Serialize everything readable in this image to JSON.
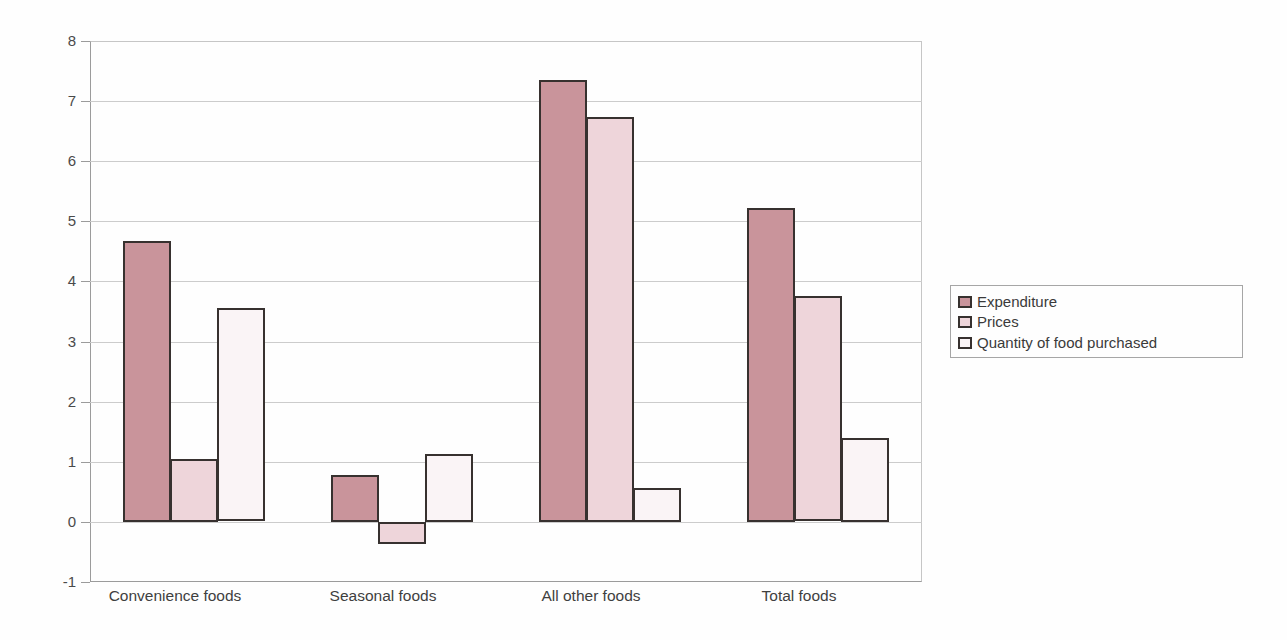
{
  "chart_data": {
    "type": "bar",
    "title": "",
    "xlabel": "",
    "ylabel": "",
    "categories": [
      "Convenience foods",
      "Seasonal foods",
      "All other foods",
      "Total foods"
    ],
    "series": [
      {
        "name": "Expenditure",
        "color": "#c9949b",
        "values": [
          4.67,
          0.78,
          7.35,
          5.22
        ]
      },
      {
        "name": "Prices",
        "color": "#eed5da",
        "values": [
          1.05,
          -0.37,
          6.74,
          3.75
        ]
      },
      {
        "name": "Quantity of food purchased",
        "color": "#faf4f6",
        "values": [
          3.55,
          1.13,
          0.57,
          1.4
        ]
      }
    ],
    "ylim": [
      -1,
      8
    ],
    "yticks": [
      -1,
      0,
      1,
      2,
      3,
      4,
      5,
      6,
      7,
      8
    ],
    "grid": "horizontal",
    "legend_position": "right",
    "bar_outline_color": "#37312f",
    "gridline_color": "#cccccc",
    "background_color": "#fefefe"
  },
  "legend": {
    "items": [
      "Expenditure",
      "Prices",
      "Quantity of food purchased"
    ]
  }
}
